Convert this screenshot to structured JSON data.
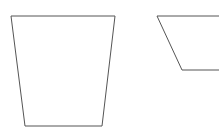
{
  "canvas": {
    "width": 219,
    "height": 138,
    "background_color": "#ffffff",
    "description": "Two geometric quadrilateral outlines on a plain white background"
  },
  "style": {
    "stroke_color": "#555555",
    "stroke_width": 1,
    "fill": "none"
  },
  "shapes": [
    {
      "name": "left-trapezoid",
      "type": "trapezoid",
      "closed": true,
      "clipped": false,
      "points": "11,16 115,16 102,126 25,126",
      "vertices": [
        {
          "x": 11,
          "y": 16
        },
        {
          "x": 115,
          "y": 16
        },
        {
          "x": 102,
          "y": 126
        },
        {
          "x": 25,
          "y": 126
        }
      ],
      "top_width": 104,
      "bottom_width": 77,
      "height": 110
    },
    {
      "name": "right-trapezoid-clipped",
      "type": "trapezoid",
      "closed": false,
      "clipped": true,
      "clipped_edge": "right",
      "points": "219,16 157,16 182,70 219,70",
      "vertices": [
        {
          "x": 219,
          "y": 16
        },
        {
          "x": 157,
          "y": 16
        },
        {
          "x": 182,
          "y": 70
        },
        {
          "x": 219,
          "y": 70
        }
      ],
      "top_edge_y": 16,
      "bottom_edge_y": 70,
      "height": 54
    }
  ]
}
